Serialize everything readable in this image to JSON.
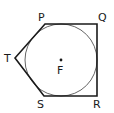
{
  "diagram": {
    "type": "geometry",
    "labels": {
      "P": "P",
      "Q": "Q",
      "R": "R",
      "S": "S",
      "T": "T",
      "F": "F"
    },
    "colors": {
      "polygon_stroke": "#1a1a1a",
      "circle_stroke": "#666666",
      "center_point": "#1a1a1a"
    }
  }
}
